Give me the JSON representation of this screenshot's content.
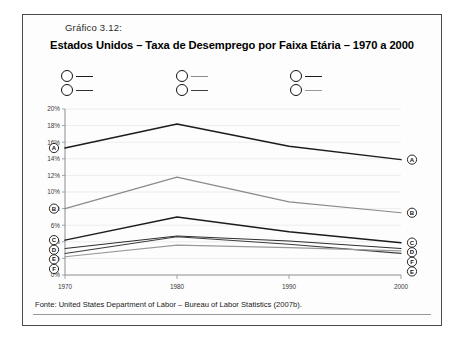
{
  "figure": {
    "caption_tag": "Gráfico 3.12:",
    "title": "Estados Unidos – Taxa de Desemprego por Faixa Etária – 1970 a 2000",
    "source": "Fonte: United States Department of Labor – Bureau of Labor Statistics (2007b)."
  },
  "legend": [
    {
      "key": "A",
      "label": "16 A 19 ANOS"
    },
    {
      "key": "B",
      "label": "20 A 24 ANOS"
    },
    {
      "key": "C",
      "label": "25 A 34 ANOS"
    },
    {
      "key": "D",
      "label": "35 A 44 ANOS"
    },
    {
      "key": "E",
      "label": "45 A 54 ANOS"
    },
    {
      "key": "F",
      "label": "ACIMA DE 54 ANOS"
    }
  ],
  "chart_data": {
    "type": "line",
    "title": "Estados Unidos – Taxa de Desemprego por Faixa Etária – 1970 a 2000",
    "xlabel": "",
    "ylabel": "",
    "x": [
      1970,
      1980,
      1990,
      2000
    ],
    "categories": [
      "1970",
      "1980",
      "1990",
      "2000"
    ],
    "ylim": [
      0,
      20
    ],
    "ytick_step": 2,
    "ytick_labels": [
      "0%",
      "2%",
      "4%",
      "6%",
      "8%",
      "10%",
      "12%",
      "14%",
      "16%",
      "18%",
      "20%"
    ],
    "ytick_values": [
      0,
      2,
      4,
      6,
      8,
      10,
      12,
      14,
      16,
      18,
      20
    ],
    "grid": true,
    "legend_position": "top",
    "value_unit": "%",
    "series": [
      {
        "name": "16 A 19 ANOS",
        "key": "A",
        "color": "#1c1c1c",
        "width": 1.5,
        "values": [
          15.3,
          18.2,
          15.5,
          13.9
        ]
      },
      {
        "name": "20 A 24 ANOS",
        "key": "B",
        "color": "#8a8a8a",
        "width": 1.2,
        "values": [
          8.0,
          11.8,
          8.8,
          7.5
        ]
      },
      {
        "name": "25 A 34 ANOS",
        "key": "C",
        "color": "#1c1c1c",
        "width": 1.5,
        "values": [
          4.2,
          7.0,
          5.2,
          3.9
        ]
      },
      {
        "name": "35 A 44 ANOS",
        "key": "D",
        "color": "#2e2e2e",
        "width": 1.1,
        "values": [
          3.2,
          4.7,
          4.1,
          3.2
        ]
      },
      {
        "name": "45 A 54 ANOS",
        "key": "E",
        "color": "#3d3d3d",
        "width": 1.1,
        "values": [
          2.6,
          4.6,
          3.7,
          2.6
        ]
      },
      {
        "name": "ACIMA DE 54 ANOS",
        "key": "F",
        "color": "#9a9a9a",
        "width": 1.2,
        "values": [
          2.2,
          3.6,
          3.3,
          2.9
        ]
      }
    ],
    "endpoint_markers": {
      "left": [
        "A",
        "B",
        "C",
        "D",
        "E",
        "F"
      ],
      "right": [
        "A",
        "B",
        "C",
        "D",
        "F",
        "E"
      ]
    }
  }
}
